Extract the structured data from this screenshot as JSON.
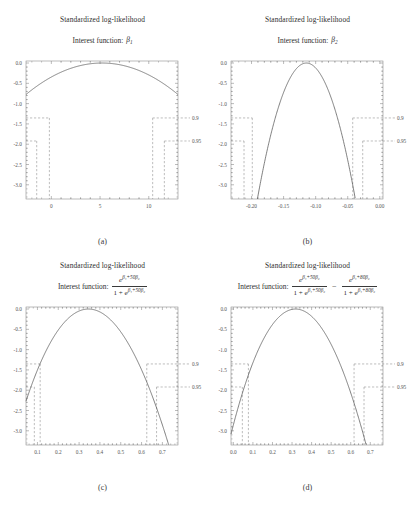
{
  "figure": {
    "panels": [
      "a",
      "b",
      "c",
      "d"
    ]
  },
  "chart_data": [
    {
      "id": "a",
      "type": "line",
      "title": "Standardized log-likelihood",
      "subtitle_label": "Interest function:",
      "interest_function": "beta_1",
      "interest_symbol": "β",
      "interest_subscript": "1",
      "caption": "(a)",
      "xlabel": "",
      "ylabel": "",
      "xlim": [
        -2.6,
        13.0
      ],
      "ylim": [
        -3.35,
        0.05
      ],
      "xticks": [
        0,
        5,
        10
      ],
      "xtick_labels": [
        "0",
        "5",
        "10"
      ],
      "yticks": [
        0.0,
        -0.5,
        -1.0,
        -1.5,
        -2.0,
        -2.5,
        -3.0
      ],
      "ytick_labels": [
        "0.0",
        "-0.5",
        "-1.0",
        "-1.5",
        "-2.0",
        "-2.5",
        "-3.0"
      ],
      "mle": 5.2,
      "curvature": 0.0255,
      "conf_levels": [
        {
          "label": "0.9",
          "cutoff": -1.353,
          "lower": -0.2,
          "upper": 10.4
        },
        {
          "label": "0.95",
          "cutoff": -1.921,
          "lower": -1.5,
          "upper": 11.6
        }
      ],
      "grid": false,
      "legend": "none"
    },
    {
      "id": "b",
      "type": "line",
      "title": "Standardized log-likelihood",
      "subtitle_label": "Interest function:",
      "interest_function": "beta_2",
      "interest_symbol": "β",
      "interest_subscript": "2",
      "caption": "(b)",
      "xlabel": "",
      "ylabel": "",
      "xlim": [
        -0.232,
        0.005
      ],
      "ylim": [
        -3.35,
        0.05
      ],
      "xticks": [
        -0.2,
        -0.15,
        -0.1,
        -0.05,
        0.0
      ],
      "xtick_labels": [
        "-0.20",
        "-0.15",
        "-0.10",
        "-0.05",
        "0.00"
      ],
      "yticks": [
        0.0,
        -0.5,
        -1.0,
        -1.5,
        -2.0,
        -2.5,
        -3.0
      ],
      "ytick_labels": [
        "0.0",
        "-0.5",
        "-1.0",
        "-1.5",
        "-2.0",
        "-2.5",
        "-3.0"
      ],
      "mle": -0.1145,
      "curvature": 1150.0,
      "conf_levels": [
        {
          "label": "0.9",
          "cutoff": -1.353,
          "lower": -0.1988,
          "upper": -0.0422
        },
        {
          "label": "0.95",
          "cutoff": -1.921,
          "lower": -0.2117,
          "upper": -0.0266
        }
      ],
      "grid": false,
      "legend": "none"
    },
    {
      "id": "c",
      "type": "line",
      "title": "Standardized log-likelihood",
      "subtitle_label": "Interest function:",
      "interest_function": "exp(beta_1+50*beta_2)/(1+exp(beta_1+50*beta_2))",
      "formula": {
        "numerator_base": "e",
        "numerator_exponent": "β₁+50β₂",
        "denominator": "1 + e",
        "denominator_exponent": "β₁+50β₂"
      },
      "caption": "(c)",
      "xlabel": "",
      "ylabel": "",
      "xlim": [
        0.045,
        0.775
      ],
      "ylim": [
        -3.35,
        0.05
      ],
      "xticks": [
        0.1,
        0.2,
        0.3,
        0.4,
        0.5,
        0.6,
        0.7
      ],
      "xtick_labels": [
        "0.1",
        "0.2",
        "0.3",
        "0.4",
        "0.5",
        "0.6",
        "0.7"
      ],
      "yticks": [
        0.0,
        -0.5,
        -1.0,
        -1.5,
        -2.0,
        -2.5,
        -3.0
      ],
      "ytick_labels": [
        "0.0",
        "-0.5",
        "-1.0",
        "-1.5",
        "-2.0",
        "-2.5",
        "-3.0"
      ],
      "mle": 0.345,
      "skew": -0.33,
      "curvature": 12.0,
      "conf_levels": [
        {
          "label": "0.9",
          "cutoff": -1.353,
          "lower": 0.113,
          "upper": 0.625
        },
        {
          "label": "0.95",
          "cutoff": -1.921,
          "lower": 0.085,
          "upper": 0.672
        }
      ],
      "grid": false,
      "legend": "none"
    },
    {
      "id": "d",
      "type": "line",
      "title": "Standardized log-likelihood",
      "subtitle_label": "Interest function:",
      "interest_function": "exp(beta_1+50*beta_2)/(1+exp(beta_1+50*beta_2)) - exp(beta_1+80*beta_2)/(1+exp(beta_1+80*beta_2))",
      "formula": {
        "term1": {
          "numerator_base": "e",
          "numerator_exponent": "β₁+50β₂",
          "denominator": "1 + e",
          "denominator_exponent": "β₁+50β₂"
        },
        "operator": "−",
        "term2": {
          "numerator_base": "e",
          "numerator_exponent": "β₁+80β₂",
          "denominator": "1 + e",
          "denominator_exponent": "β₁+80β₂"
        }
      },
      "caption": "(d)",
      "xlabel": "",
      "ylabel": "",
      "xlim": [
        -0.012,
        0.765
      ],
      "ylim": [
        -3.35,
        0.05
      ],
      "xticks": [
        0.0,
        0.1,
        0.2,
        0.3,
        0.4,
        0.5,
        0.6,
        0.7
      ],
      "xtick_labels": [
        "0.0",
        "0.1",
        "0.2",
        "0.3",
        "0.4",
        "0.5",
        "0.6",
        "0.7"
      ],
      "yticks": [
        0.0,
        -0.5,
        -1.0,
        -1.5,
        -2.0,
        -2.5,
        -3.0
      ],
      "ytick_labels": [
        "0.0",
        "-0.5",
        "-1.0",
        "-1.5",
        "-2.0",
        "-2.5",
        "-3.0"
      ],
      "mle": 0.318,
      "skew": -0.28,
      "curvature": 13.5,
      "conf_levels": [
        {
          "label": "0.9",
          "cutoff": -1.353,
          "lower": 0.077,
          "upper": 0.617
        },
        {
          "label": "0.95",
          "cutoff": -1.921,
          "lower": 0.046,
          "upper": 0.668
        }
      ],
      "grid": false,
      "legend": "none"
    }
  ],
  "style": {
    "curve_color": "#555555",
    "axis_color": "#777777",
    "dash_color": "#888888",
    "text_color": "#3a3a3a",
    "background": "#ffffff"
  }
}
